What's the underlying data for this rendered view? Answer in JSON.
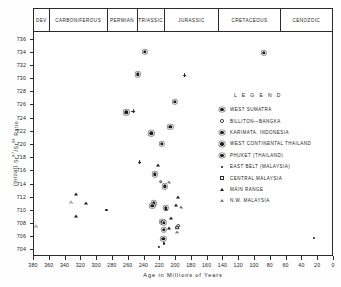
{
  "chart_data": {
    "type": "scatter",
    "title": "",
    "xlabel": "Age  in  Millions  of  Years",
    "ylabel": "(Initial) Sr87/Sr86 Ratio",
    "xlim": [
      380,
      0
    ],
    "ylim": [
      703,
      737
    ],
    "xticks": [
      380,
      360,
      340,
      320,
      300,
      280,
      260,
      240,
      220,
      200,
      180,
      160,
      140,
      120,
      100,
      80,
      60,
      40,
      20,
      0
    ],
    "yticks": [
      736,
      734,
      732,
      730,
      728,
      726,
      724,
      722,
      720,
      718,
      716,
      714,
      712,
      710,
      708,
      706,
      704
    ],
    "grid": false,
    "legend_position": "right-upper",
    "period_band": [
      {
        "label": "DEV",
        "start": 380,
        "end": 360
      },
      {
        "label": "CARBONIFEROUS",
        "start": 360,
        "end": 286
      },
      {
        "label": "PERMIAN",
        "start": 286,
        "end": 248
      },
      {
        "label": "TRIASSIC",
        "start": 248,
        "end": 213
      },
      {
        "label": "JURASSIC",
        "start": 213,
        "end": 144
      },
      {
        "label": "CRETACEOUS",
        "start": 144,
        "end": 65
      },
      {
        "label": "CENOZOIC",
        "start": 65,
        "end": 0
      }
    ],
    "series": [
      {
        "name": "WEST SUMATRA",
        "marker": "filled-circle",
        "points": [
          {
            "x": 247,
            "y": 730.6
          },
          {
            "x": 262,
            "y": 724.8
          },
          {
            "x": 230,
            "y": 721.6
          },
          {
            "x": 217,
            "y": 720.0
          },
          {
            "x": 226,
            "y": 715.4
          },
          {
            "x": 213,
            "y": 713.6
          },
          {
            "x": 227,
            "y": 711.0
          },
          {
            "x": 212,
            "y": 710.3
          },
          {
            "x": 216,
            "y": 708.2
          },
          {
            "x": 214,
            "y": 707.0
          },
          {
            "x": 215,
            "y": 705.6
          },
          {
            "x": 88,
            "y": 733.8
          },
          {
            "x": 200,
            "y": 726.4
          }
        ]
      },
      {
        "name": "BILLITON-BANGKA",
        "marker": "open-circle",
        "points": [
          {
            "x": 218,
            "y": 714.3
          },
          {
            "x": 196,
            "y": 707.6
          }
        ]
      },
      {
        "name": "KARIMATA, INDONESIA",
        "marker": "filled-circle-bold",
        "points": [
          {
            "x": 238,
            "y": 734.0
          },
          {
            "x": 206,
            "y": 722.6
          }
        ]
      },
      {
        "name": "WEST CONTINENTAL THAILAND",
        "marker": "plus",
        "points": [
          {
            "x": 188,
            "y": 730.4
          },
          {
            "x": 253,
            "y": 725.0
          },
          {
            "x": 245,
            "y": 717.2
          }
        ]
      },
      {
        "name": "PHUKET (THAILAND)",
        "marker": "filled-circle-ring",
        "points": [
          {
            "x": 229,
            "y": 710.6
          },
          {
            "x": 214,
            "y": 708.0
          }
        ]
      },
      {
        "name": "EAST BELT (MALAYSIA)",
        "marker": "dot",
        "points": [
          {
            "x": 287,
            "y": 710.0
          },
          {
            "x": 221,
            "y": 704.4
          },
          {
            "x": 214,
            "y": 704.9
          },
          {
            "x": 24,
            "y": 705.8
          }
        ]
      },
      {
        "name": "CENTRAL MALAYSIA",
        "marker": "open-square",
        "points": [
          {
            "x": 197,
            "y": 707.3
          }
        ]
      },
      {
        "name": "MAIN RANGE",
        "marker": "filled-triangle",
        "points": [
          {
            "x": 325,
            "y": 712.4
          },
          {
            "x": 313,
            "y": 711.0
          },
          {
            "x": 326,
            "y": 709.0
          },
          {
            "x": 222,
            "y": 716.8
          },
          {
            "x": 196,
            "y": 712.0
          },
          {
            "x": 199,
            "y": 710.8
          },
          {
            "x": 212,
            "y": 710.2
          },
          {
            "x": 205,
            "y": 708.8
          },
          {
            "x": 208,
            "y": 707.2
          }
        ]
      },
      {
        "name": "N.W. MALAYSIA",
        "marker": "open-triangle",
        "points": [
          {
            "x": 332,
            "y": 711.2
          },
          {
            "x": 376,
            "y": 707.6
          },
          {
            "x": 208,
            "y": 714.2
          },
          {
            "x": 193,
            "y": 710.4
          },
          {
            "x": 197,
            "y": 706.6
          }
        ]
      }
    ]
  },
  "legend": {
    "title": "L E G E N D",
    "entries": [
      {
        "label": "WEST  SUMATRA",
        "marker": "filled-circle-ring"
      },
      {
        "label": "BILLITON—BANGKA",
        "marker": "open-circle"
      },
      {
        "label": "KARIMATA,  INDONESIA",
        "marker": "filled-circle-ring"
      },
      {
        "label": "WEST  CONTINENTAL  THAILAND",
        "marker": "filled-circle-ring"
      },
      {
        "label": "PHUKET  (THAILAND)",
        "marker": "filled-circle-ring"
      },
      {
        "label": "EAST  BELT (MALAYSIA)",
        "marker": "dot"
      },
      {
        "label": "CENTRAL  MALAYSIA",
        "marker": "open-square"
      },
      {
        "label": "MAIN  RANGE",
        "marker": "filled-triangle"
      },
      {
        "label": "N.W.  MALAYSIA",
        "marker": "open-triangle"
      }
    ]
  },
  "axis": {
    "x_title": "Age   in   Millions   of   Years",
    "y_title_prefix": "(Initial)",
    "y_title_main": "Sr / Sr  Ratio",
    "y_sup_1": "87",
    "y_sup_2": "86"
  }
}
